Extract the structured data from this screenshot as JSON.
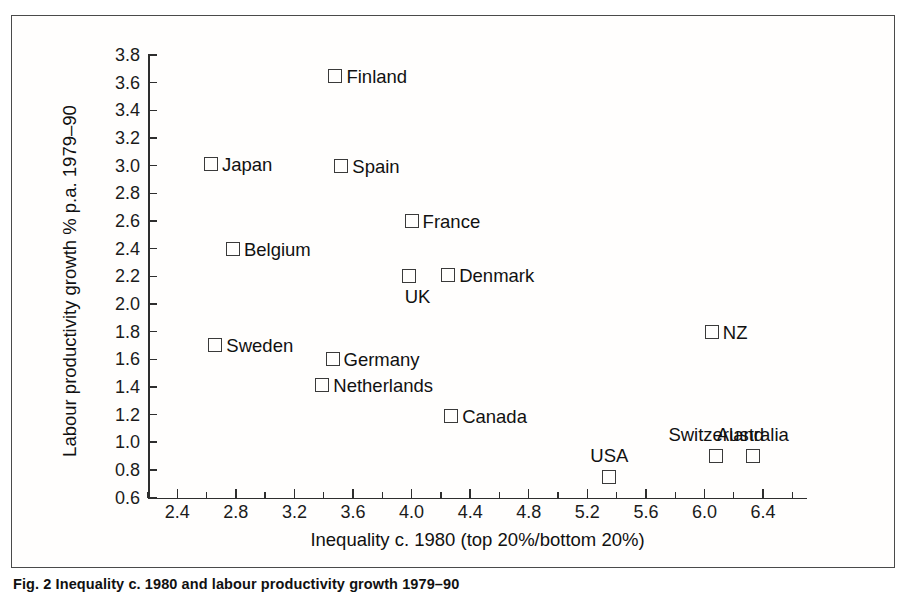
{
  "figure": {
    "caption": "Fig. 2 Inequality c. 1980 and labour productivity growth 1979–90",
    "frame_color": "#4a4a4a",
    "marker_color": "#3a3a3a",
    "text_color": "#111111"
  },
  "chart_data": {
    "type": "scatter",
    "title": "",
    "xlabel": "Inequality c. 1980 (top 20%/bottom 20%)",
    "ylabel": "Labour productivity growth % p.a. 1979–90",
    "xlim": [
      2.2,
      6.7
    ],
    "ylim": [
      0.6,
      3.8
    ],
    "grid": false,
    "legend": "none",
    "marker_style": "open-square",
    "x_ticks": [
      2.4,
      2.8,
      3.2,
      3.6,
      4.0,
      4.4,
      4.8,
      5.2,
      5.6,
      6.0,
      6.4
    ],
    "x_tick_labels": [
      "2.4",
      "2.8",
      "3.2",
      "3.6",
      "4.0",
      "4.4",
      "4.8",
      "5.2",
      "5.6",
      "6.0",
      "6.4"
    ],
    "x_minor_ticks": [
      2.2,
      2.6,
      3.0,
      3.4,
      3.8,
      4.2,
      4.6,
      5.0,
      5.4,
      5.8,
      6.2,
      6.6
    ],
    "y_ticks": [
      0.6,
      0.8,
      1.0,
      1.2,
      1.4,
      1.6,
      1.8,
      2.0,
      2.2,
      2.4,
      2.6,
      2.8,
      3.0,
      3.2,
      3.4,
      3.6,
      3.8
    ],
    "y_tick_labels": [
      "0.6",
      "0.8",
      "1.0",
      "1.2",
      "1.4",
      "1.6",
      "1.8",
      "2.0",
      "2.2",
      "2.4",
      "2.6",
      "2.8",
      "3.0",
      "3.2",
      "3.4",
      "3.6",
      "3.8"
    ],
    "points": [
      {
        "label": "Finland",
        "x": 3.48,
        "y": 3.65,
        "label_pos": "right"
      },
      {
        "label": "Japan",
        "x": 2.63,
        "y": 3.01,
        "label_pos": "right"
      },
      {
        "label": "Spain",
        "x": 3.52,
        "y": 3.0,
        "label_pos": "right"
      },
      {
        "label": "France",
        "x": 4.0,
        "y": 2.6,
        "label_pos": "right"
      },
      {
        "label": "Belgium",
        "x": 2.78,
        "y": 2.4,
        "label_pos": "right"
      },
      {
        "label": "UK",
        "x": 3.98,
        "y": 2.2,
        "label_pos": "below"
      },
      {
        "label": "Denmark",
        "x": 4.25,
        "y": 2.21,
        "label_pos": "right"
      },
      {
        "label": "NZ",
        "x": 6.05,
        "y": 1.8,
        "label_pos": "right"
      },
      {
        "label": "Sweden",
        "x": 2.66,
        "y": 1.7,
        "label_pos": "right"
      },
      {
        "label": "Germany",
        "x": 3.46,
        "y": 1.6,
        "label_pos": "right"
      },
      {
        "label": "Netherlands",
        "x": 3.39,
        "y": 1.41,
        "label_pos": "right"
      },
      {
        "label": "Canada",
        "x": 4.27,
        "y": 1.19,
        "label_pos": "right"
      },
      {
        "label": "Switzerland",
        "x": 6.08,
        "y": 0.9,
        "label_pos": "above-c"
      },
      {
        "label": "Australia",
        "x": 6.33,
        "y": 0.9,
        "label_pos": "above-c"
      },
      {
        "label": "USA",
        "x": 5.35,
        "y": 0.75,
        "label_pos": "above-c"
      }
    ]
  }
}
